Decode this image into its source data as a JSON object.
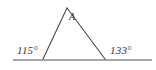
{
  "figure": {
    "kind": "geometry-diagram",
    "background_color": "#ffffff",
    "line_color": "#4a4a4a",
    "baseline_color": "#8a8a8a",
    "text_color": "#3a3a3a",
    "width": 156,
    "height": 70
  },
  "labels": {
    "apex_vertex": "A",
    "left_angle": "115°",
    "right_angle": "133°"
  },
  "geometry": {
    "baseline": {
      "x1": 13,
      "y1": 60,
      "x2": 152,
      "y2": 60
    },
    "apex": {
      "x": 67,
      "y": 8
    },
    "left_vertex": {
      "x": 43,
      "y": 59
    },
    "right_vertex": {
      "x": 105,
      "y": 59
    }
  }
}
